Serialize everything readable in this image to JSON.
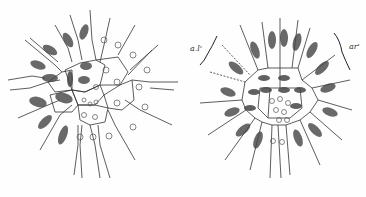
{
  "caption_fragment": "",
  "figures": [
    {
      "id": "left",
      "description": "Radial cell diagram with dividing nuclei on left side and resting nuclei on right"
    },
    {
      "id": "right",
      "description": "Radial cell diagram with dividing nuclei all around, central small cells"
    }
  ],
  "labels": {
    "left_bracket": "a.l'",
    "right_bracket": "ar'"
  },
  "colors": {
    "ink": "#222222",
    "background": "#fefefe",
    "nucleus": "#444444"
  }
}
